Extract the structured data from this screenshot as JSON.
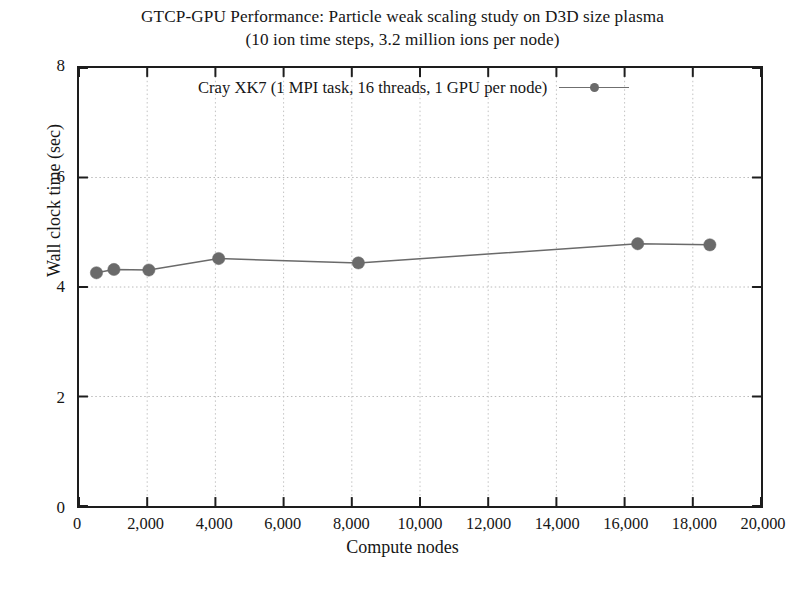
{
  "chart_data": {
    "type": "line",
    "title": "GTCP-GPU Performance: Particle weak scaling study on D3D size plasma",
    "subtitle": "(10 ion time steps, 3.2 million ions per node)",
    "xlabel": "Compute nodes",
    "ylabel": "Wall clock time (sec)",
    "xlim": [
      0,
      20000
    ],
    "ylim": [
      0,
      8
    ],
    "xticks": [
      0,
      2000,
      4000,
      6000,
      8000,
      10000,
      12000,
      14000,
      16000,
      18000,
      20000
    ],
    "xtick_labels": [
      "0",
      "2,000",
      "4,000",
      "6,000",
      "8,000",
      "10,000",
      "12,000",
      "14,000",
      "16,000",
      "18,000",
      "20,000"
    ],
    "yticks": [
      0,
      2,
      4,
      6,
      8
    ],
    "ytick_labels": [
      "0",
      "2",
      "4",
      "6",
      "8"
    ],
    "grid": "dotted-both-axes",
    "legend_position": "top-center-inside",
    "series": [
      {
        "name": "Cray XK7 (1 MPI task, 16 threads, 1 GPU per node)",
        "color": "#6a6a6a",
        "marker": "filled-circle",
        "x": [
          512,
          1024,
          2048,
          4096,
          8192,
          16384,
          18500
        ],
        "y": [
          4.26,
          4.32,
          4.31,
          4.52,
          4.44,
          4.79,
          4.77
        ]
      }
    ]
  },
  "legend": {
    "entry_label": "Cray XK7 (1 MPI task, 16 threads, 1 GPU per node)"
  }
}
